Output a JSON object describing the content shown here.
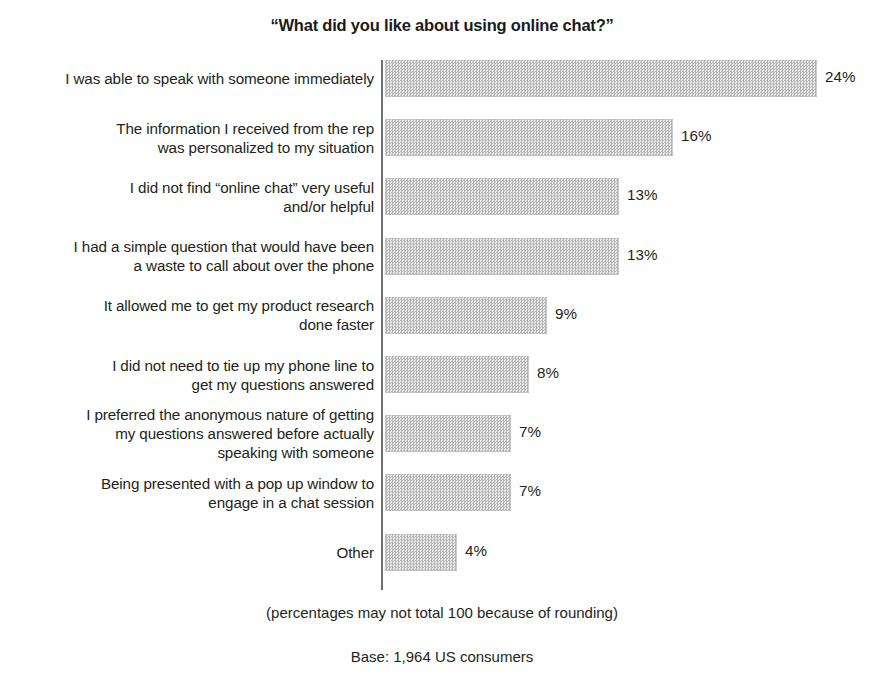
{
  "chart_data": {
    "type": "bar",
    "orientation": "horizontal",
    "title": "“What did you like about using online chat?”",
    "xlabel": "",
    "ylabel": "",
    "xlim": [
      0,
      24
    ],
    "grid": false,
    "legend": false,
    "value_suffix": "%",
    "categories": [
      "I was able to speak with someone immediately",
      "The information I received from the rep\nwas personalized to my situation",
      "I did not find “online chat” very useful\nand/or helpful",
      "I had a simple question that would have been\na waste to call about over the phone",
      "It allowed me to get my product research\ndone faster",
      "I did not need to tie up my phone line to\nget my questions answered",
      "I preferred the anonymous nature of getting\nmy questions answered before actually\nspeaking with someone",
      "Being presented with a pop up window to\nengage in a chat session",
      "Other"
    ],
    "values": [
      24,
      16,
      13,
      13,
      9,
      8,
      7,
      7,
      4
    ],
    "value_labels": [
      "24%",
      "16%",
      "13%",
      "13%",
      "9%",
      "8%",
      "7%",
      "7%",
      "4%"
    ],
    "bar_fill": "#c9c9c9",
    "axis_color": "#6d6e71",
    "text_color": "#231f20"
  },
  "footnotes": {
    "rounding": "(percentages may not total 100 because of rounding)",
    "base": "Base: 1,964 US consumers"
  }
}
